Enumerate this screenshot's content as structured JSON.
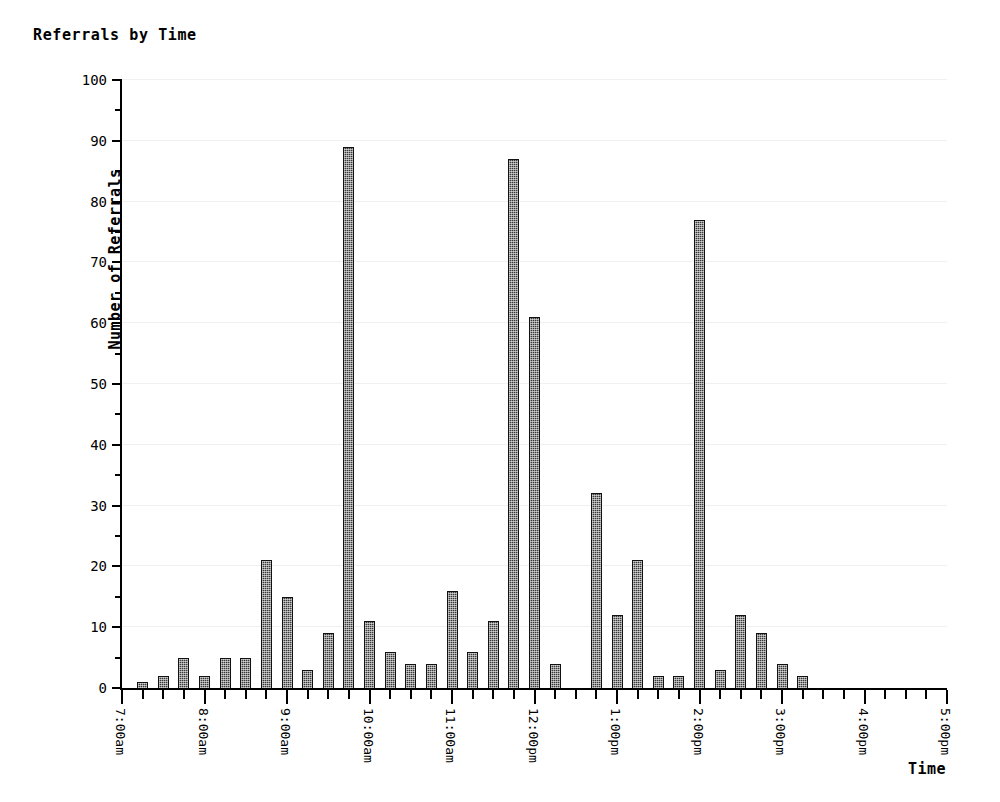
{
  "chart_data": {
    "type": "bar",
    "title": "Referrals by Time",
    "xlabel": "Time",
    "ylabel": "Number of Referrals",
    "ylim": [
      0,
      100
    ],
    "ytick_step": 10,
    "yminor_step": 5,
    "grid": true,
    "legend": null,
    "x_axis_type": "time",
    "x_start": "7:00am",
    "x_end": "5:00pm",
    "x_tick_interval_minutes": 15,
    "ytick_labels": [
      "0",
      "10",
      "20",
      "30",
      "40",
      "50",
      "60",
      "70",
      "80",
      "90",
      "100"
    ],
    "ytick_values": [
      0,
      10,
      20,
      30,
      40,
      50,
      60,
      70,
      80,
      90,
      100
    ],
    "xtick_labels": [
      "7:00am",
      "8:00am",
      "9:00am",
      "10:00am",
      "11:00am",
      "12:00pm",
      "1:00pm",
      "2:00pm",
      "3:00pm",
      "4:00pm",
      "5:00pm"
    ],
    "xtick_hours": [
      7,
      8,
      9,
      10,
      11,
      12,
      13,
      14,
      15,
      16,
      17
    ],
    "categories": [
      "7:15am",
      "7:30am",
      "7:45am",
      "8:00am",
      "8:15am",
      "8:30am",
      "8:45am",
      "9:00am",
      "9:15am",
      "9:30am",
      "9:45am",
      "10:00am",
      "10:15am",
      "10:30am",
      "10:45am",
      "11:00am",
      "11:15am",
      "11:30am",
      "11:45am",
      "12:00pm",
      "12:15pm",
      "12:30pm",
      "12:45pm",
      "1:00pm",
      "1:15pm",
      "1:30pm",
      "1:45pm",
      "2:00pm",
      "2:15pm",
      "2:30pm",
      "2:45pm",
      "3:00pm",
      "3:15pm",
      "3:30pm"
    ],
    "values": [
      1,
      2,
      5,
      2,
      5,
      5,
      21,
      15,
      3,
      9,
      89,
      11,
      6,
      4,
      4,
      16,
      6,
      11,
      87,
      61,
      4,
      0,
      32,
      12,
      21,
      2,
      2,
      77,
      3,
      12,
      9,
      4,
      2,
      0
    ],
    "bars": [
      {
        "time": "7:15am",
        "hour": 7.25,
        "value": 1
      },
      {
        "time": "7:30am",
        "hour": 7.5,
        "value": 2
      },
      {
        "time": "7:45am",
        "hour": 7.75,
        "value": 5
      },
      {
        "time": "8:00am",
        "hour": 8.0,
        "value": 2
      },
      {
        "time": "8:15am",
        "hour": 8.25,
        "value": 5
      },
      {
        "time": "8:30am",
        "hour": 8.5,
        "value": 5
      },
      {
        "time": "8:45am",
        "hour": 8.75,
        "value": 21
      },
      {
        "time": "9:00am",
        "hour": 9.0,
        "value": 15
      },
      {
        "time": "9:15am",
        "hour": 9.25,
        "value": 3
      },
      {
        "time": "9:30am",
        "hour": 9.5,
        "value": 9
      },
      {
        "time": "9:45am",
        "hour": 9.75,
        "value": 89
      },
      {
        "time": "10:00am",
        "hour": 10.0,
        "value": 11
      },
      {
        "time": "10:15am",
        "hour": 10.25,
        "value": 6
      },
      {
        "time": "10:30am",
        "hour": 10.5,
        "value": 4
      },
      {
        "time": "10:45am",
        "hour": 10.75,
        "value": 4
      },
      {
        "time": "11:00am",
        "hour": 11.0,
        "value": 16
      },
      {
        "time": "11:15am",
        "hour": 11.25,
        "value": 6
      },
      {
        "time": "11:30am",
        "hour": 11.5,
        "value": 11
      },
      {
        "time": "11:45am",
        "hour": 11.75,
        "value": 87
      },
      {
        "time": "12:00pm",
        "hour": 12.0,
        "value": 61
      },
      {
        "time": "12:15pm",
        "hour": 12.25,
        "value": 4
      },
      {
        "time": "12:45pm",
        "hour": 12.75,
        "value": 32
      },
      {
        "time": "1:00pm",
        "hour": 13.0,
        "value": 12
      },
      {
        "time": "1:15pm",
        "hour": 13.25,
        "value": 21
      },
      {
        "time": "1:30pm",
        "hour": 13.5,
        "value": 2
      },
      {
        "time": "1:45pm",
        "hour": 13.75,
        "value": 2
      },
      {
        "time": "2:00pm",
        "hour": 14.0,
        "value": 77
      },
      {
        "time": "2:15pm",
        "hour": 14.25,
        "value": 3
      },
      {
        "time": "2:30pm",
        "hour": 14.5,
        "value": 12
      },
      {
        "time": "2:45pm",
        "hour": 14.75,
        "value": 9
      },
      {
        "time": "3:00pm",
        "hour": 15.0,
        "value": 4
      },
      {
        "time": "3:15pm",
        "hour": 15.25,
        "value": 2
      }
    ],
    "colors": {
      "bar_fill": "#3a3a3a",
      "bar_edge": "#111111",
      "axis": "#000000",
      "grid": "#f0f0f0",
      "background": "#ffffff",
      "text": "#000000"
    }
  }
}
